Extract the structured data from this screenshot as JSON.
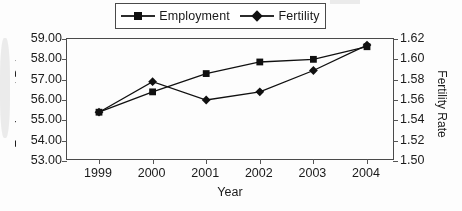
{
  "chart_data": {
    "type": "line",
    "title": "",
    "xlabel": "Year",
    "ylabel": "Employment Rate",
    "y2label": "Fertility Rate",
    "categories": [
      "1999",
      "2000",
      "2001",
      "2002",
      "2003",
      "2004"
    ],
    "x": [
      1999,
      2000,
      2001,
      2002,
      2003,
      2004
    ],
    "ylim": [
      53.0,
      59.0
    ],
    "y2lim": [
      1.5,
      1.62
    ],
    "ytick_step": 1.0,
    "y2tick_step": 0.02,
    "yticks": [
      "59.00",
      "58.00",
      "57.00",
      "56.00",
      "55.00",
      "54.00",
      "53.00"
    ],
    "y2ticks": [
      "1.62",
      "1.60",
      "1.58",
      "1.56",
      "1.54",
      "1.52",
      "1.50"
    ],
    "grid": false,
    "legend_position": "top-center",
    "series": [
      {
        "name": "Employment",
        "axis": "left",
        "marker": "square",
        "values": [
          55.4,
          56.4,
          57.3,
          57.87,
          58.0,
          58.62
        ]
      },
      {
        "name": "Fertility",
        "axis": "right",
        "marker": "diamond",
        "values": [
          1.548,
          1.578,
          1.56,
          1.568,
          1.589,
          1.614
        ]
      }
    ]
  },
  "legend": {
    "items": [
      {
        "label": "Employment",
        "marker": "square"
      },
      {
        "label": "Fertility",
        "marker": "diamond"
      }
    ]
  },
  "axes": {
    "x_title": "Year",
    "y_left_title": "Employment Rate",
    "y_right_title": "Fertility Rate"
  },
  "colors": {
    "series": "#101010",
    "frame": "#4a4a4a",
    "text": "#1a1a1a",
    "background": "#ffffff"
  }
}
